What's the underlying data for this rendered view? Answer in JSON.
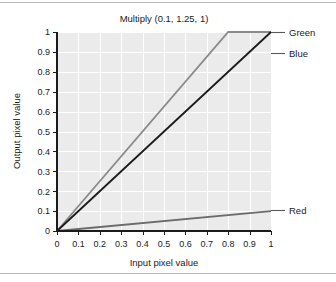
{
  "chart_data": {
    "type": "line",
    "title": "Multiply (0.1, 1.25, 1)",
    "xlabel": "Input pixel value",
    "ylabel": "Output pixel value",
    "xlim": [
      0,
      1
    ],
    "ylim": [
      0,
      1
    ],
    "grid": true,
    "legend_position": "right-of-axes-with-leader-lines",
    "xticks": [
      "0",
      "0.1",
      "0.2",
      "0.3",
      "0.4",
      "0.5",
      "0.6",
      "0.7",
      "0.8",
      "0.9",
      "1"
    ],
    "yticks": [
      "0",
      "0.1",
      "0.2",
      "0.3",
      "0.4",
      "0.5",
      "0.6",
      "0.7",
      "0.8",
      "0.9",
      "1"
    ],
    "xtick_values": [
      0,
      0.1,
      0.2,
      0.3,
      0.4,
      0.5,
      0.6,
      0.7,
      0.8,
      0.9,
      1
    ],
    "ytick_values": [
      0,
      0.1,
      0.2,
      0.3,
      0.4,
      0.5,
      0.6,
      0.7,
      0.8,
      0.9,
      1
    ],
    "series": [
      {
        "name": "Red",
        "slope": 0.1,
        "color": "#6b6b6b",
        "x": [
          0,
          1
        ],
        "values": [
          0,
          0.1
        ],
        "label_y": 0.105
      },
      {
        "name": "Green",
        "slope": 1.25,
        "color": "#8a8a8a",
        "x": [
          0,
          0.8,
          1
        ],
        "values": [
          0,
          1,
          1
        ],
        "label_y": 1.0
      },
      {
        "name": "Blue",
        "slope": 1,
        "color": "#1b1b1b",
        "x": [
          0,
          1
        ],
        "values": [
          0,
          1
        ],
        "label_y": 0.895
      }
    ]
  },
  "legend": {
    "items": [
      {
        "label": "Green"
      },
      {
        "label": "Blue"
      },
      {
        "label": "Red"
      }
    ]
  },
  "colors": {
    "plot_background": "#ebebeb",
    "grid": "#ffffff",
    "axis": "#1b1b1b",
    "frame": "#b9b9b9",
    "page_background": "#ffffff"
  }
}
